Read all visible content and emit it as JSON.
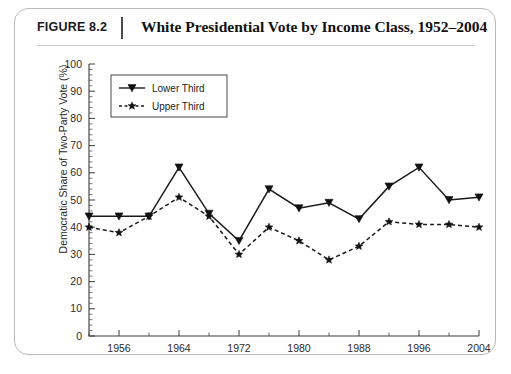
{
  "figure": {
    "label": "FIGURE 8.2",
    "title": "White Presidential Vote by Income Class, 1952–2004"
  },
  "chart_data": {
    "type": "line",
    "title": "White Presidential Vote by Income Class, 1952–2004",
    "xlabel": "",
    "ylabel": "Democratic Share of Two-Party Vote (%)",
    "ylim": [
      0,
      100
    ],
    "xlim": [
      1952,
      2004
    ],
    "ytick_step": 10,
    "grid": false,
    "legend_position": "top-left",
    "x": [
      1952,
      1956,
      1960,
      1964,
      1968,
      1972,
      1976,
      1980,
      1984,
      1988,
      1992,
      1996,
      2000,
      2004
    ],
    "xticks_major": [
      1956,
      1964,
      1972,
      1980,
      1988,
      1996,
      2004
    ],
    "yticks": [
      0,
      10,
      20,
      30,
      40,
      50,
      60,
      70,
      80,
      90,
      100
    ],
    "series": [
      {
        "name": "Lower Third",
        "marker": "triangle-down",
        "line": "solid",
        "color": "#1a1a1a",
        "values": [
          44,
          44,
          44,
          62,
          45,
          35,
          54,
          47,
          49,
          43,
          55,
          62,
          50,
          51
        ]
      },
      {
        "name": "Upper Third",
        "marker": "star",
        "line": "dashed",
        "color": "#1a1a1a",
        "values": [
          40,
          38,
          44,
          51,
          44,
          30,
          40,
          35,
          28,
          33,
          42,
          41,
          41,
          40
        ]
      }
    ]
  },
  "legend": {
    "items": [
      {
        "label": "Lower Third"
      },
      {
        "label": "Upper Third"
      }
    ]
  }
}
